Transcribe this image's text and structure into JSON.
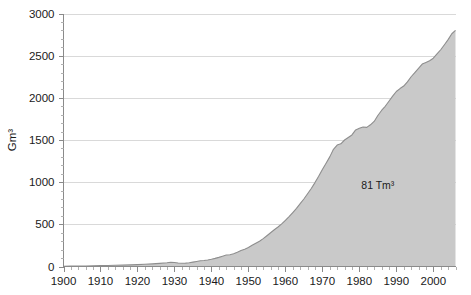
{
  "chart_data": {
    "type": "area",
    "title": "",
    "subtitle": "",
    "xlabel": "",
    "ylabel": "Gm³",
    "xlim": [
      1900,
      2006
    ],
    "ylim": [
      0,
      3000
    ],
    "grid": true,
    "legend": null,
    "legend_position": "none",
    "x_tick_labels": [
      "1900",
      "1910",
      "1920",
      "1930",
      "1940",
      "1950",
      "1960",
      "1970",
      "1980",
      "1990",
      "2000"
    ],
    "x_ticks": [
      1900,
      1910,
      1920,
      1930,
      1940,
      1950,
      1960,
      1970,
      1980,
      1990,
      2000
    ],
    "x_minor_tick_step": 2,
    "y_tick_labels": [
      "0",
      "500",
      "1000",
      "1500",
      "2000",
      "2500",
      "3000"
    ],
    "y_ticks": [
      0,
      500,
      1000,
      1500,
      2000,
      2500,
      3000
    ],
    "y_minor_tick_step": 100,
    "annotations": [
      {
        "text": "81 Tm³",
        "x": 1985,
        "y": 920
      }
    ],
    "series": [
      {
        "name": "Cumulative production",
        "fill_color": "#c9c9c9",
        "line_color": "#8e8e8e",
        "x": [
          1900,
          1902,
          1904,
          1906,
          1908,
          1910,
          1912,
          1914,
          1916,
          1918,
          1920,
          1922,
          1924,
          1926,
          1928,
          1929,
          1930,
          1931,
          1932,
          1933,
          1934,
          1935,
          1936,
          1937,
          1938,
          1939,
          1940,
          1941,
          1942,
          1943,
          1944,
          1945,
          1946,
          1947,
          1948,
          1949,
          1950,
          1951,
          1952,
          1953,
          1954,
          1955,
          1956,
          1957,
          1958,
          1959,
          1960,
          1961,
          1962,
          1963,
          1964,
          1965,
          1966,
          1967,
          1968,
          1969,
          1970,
          1971,
          1972,
          1973,
          1974,
          1975,
          1976,
          1977,
          1978,
          1979,
          1980,
          1981,
          1982,
          1983,
          1984,
          1985,
          1986,
          1987,
          1988,
          1989,
          1990,
          1991,
          1992,
          1993,
          1994,
          1995,
          1996,
          1997,
          1998,
          1999,
          2000,
          2001,
          2002,
          2003,
          2004,
          2005,
          2006
        ],
        "values": [
          3,
          4,
          5,
          6,
          8,
          10,
          12,
          14,
          16,
          19,
          22,
          26,
          31,
          37,
          44,
          50,
          48,
          42,
          38,
          40,
          45,
          52,
          60,
          68,
          72,
          78,
          86,
          96,
          108,
          122,
          136,
          140,
          152,
          170,
          190,
          205,
          225,
          252,
          276,
          300,
          330,
          365,
          400,
          436,
          468,
          505,
          548,
          592,
          640,
          690,
          745,
          800,
          862,
          925,
          995,
          1070,
          1150,
          1225,
          1300,
          1390,
          1440,
          1455,
          1500,
          1530,
          1560,
          1620,
          1640,
          1655,
          1650,
          1680,
          1720,
          1790,
          1850,
          1900,
          1960,
          2020,
          2075,
          2110,
          2140,
          2190,
          2250,
          2300,
          2350,
          2400,
          2420,
          2440,
          2470,
          2520,
          2570,
          2630,
          2690,
          2760,
          2800
        ]
      }
    ]
  }
}
